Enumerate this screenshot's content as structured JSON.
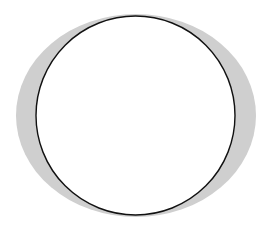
{
  "figure": {
    "width": 269,
    "height": 227,
    "background": "#ffffff",
    "shapes": [
      {
        "name": "gray-ellipse",
        "type": "ellipse",
        "cx": 136,
        "cy": 115.5,
        "rx": 120,
        "ry": 101.5,
        "fill": "#cfcfcf",
        "stroke": "none"
      },
      {
        "name": "outlined-circle",
        "type": "circle",
        "cx": 135.5,
        "cy": 115.5,
        "r": 99.5,
        "fill": "#ffffff",
        "stroke": "#111111",
        "stroke_width": 1.4
      }
    ]
  }
}
